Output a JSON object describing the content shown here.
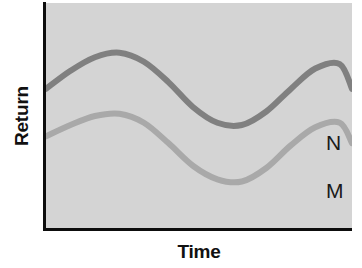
{
  "chart_data": {
    "type": "line",
    "title": "",
    "subtitle": "",
    "xlabel": "Time",
    "ylabel": "Return",
    "grid": false,
    "legend_position": "right-end-of-line",
    "xlim": [
      0,
      100
    ],
    "ylim": [
      0,
      100
    ],
    "x_tick_labels": [],
    "y_tick_labels": [],
    "annotations": [
      "N",
      "M"
    ],
    "plot_background_color": "#d4d4d4",
    "axis_color": "#0d0d0d",
    "series": [
      {
        "name": "N",
        "label": "N",
        "color": "#808080",
        "line_width": 6,
        "description": "Upper wavy curve — higher average return, two crests",
        "x": [
          0,
          8,
          16,
          24,
          32,
          40,
          48,
          56,
          64,
          72,
          80,
          88,
          96,
          100
        ],
        "values": [
          62,
          70,
          76,
          78,
          74,
          65,
          54,
          47,
          46,
          52,
          62,
          71,
          73,
          62
        ]
      },
      {
        "name": "M",
        "label": "M",
        "color": "#a9a9a9",
        "line_width": 6,
        "description": "Lower wavy curve — lower average return, parallel two crests",
        "x": [
          0,
          8,
          16,
          24,
          32,
          40,
          48,
          56,
          64,
          72,
          80,
          88,
          96,
          100
        ],
        "values": [
          41,
          46,
          50,
          51,
          47,
          38,
          28,
          22,
          21,
          27,
          37,
          45,
          47,
          38
        ]
      }
    ]
  },
  "axes": {
    "y_label": "Return",
    "x_label": "Time"
  },
  "labels": {
    "series_n": "N",
    "series_m": "M"
  },
  "colors": {
    "plot_background": "#d4d4d4",
    "page_background": "#ffffff",
    "axis": "#0d0d0d",
    "series_n": "#808080",
    "series_m": "#a9a9a9",
    "text": "#111111"
  }
}
